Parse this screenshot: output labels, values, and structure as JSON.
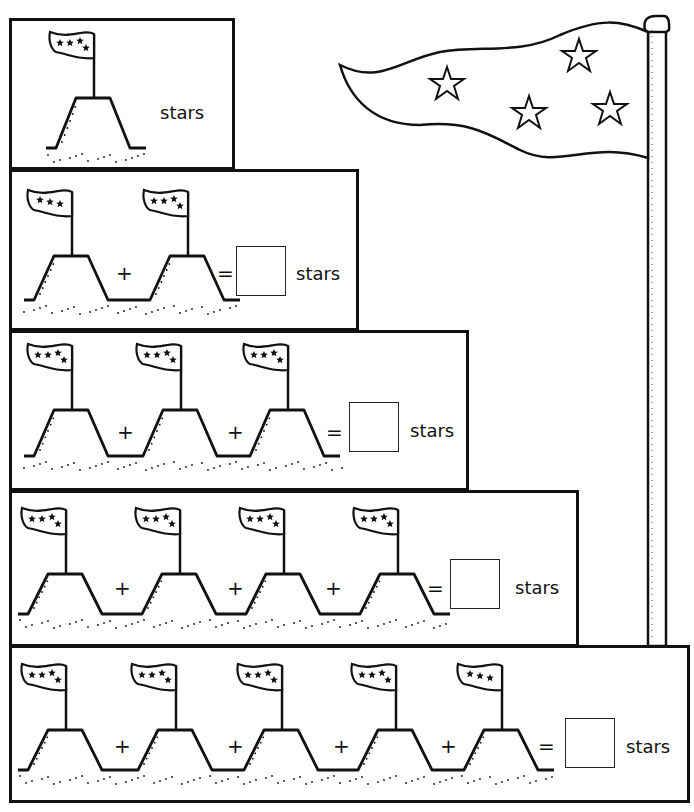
{
  "worksheet": {
    "unit_label": "stars",
    "plus_sign": "+",
    "equals_sign": "=",
    "rows": [
      {
        "id": 1,
        "flags": [
          4
        ],
        "has_answer_box": false,
        "answer": ""
      },
      {
        "id": 2,
        "flags": [
          3,
          4
        ],
        "has_answer_box": true,
        "answer": ""
      },
      {
        "id": 3,
        "flags": [
          4,
          4,
          4
        ],
        "has_answer_box": true,
        "answer": ""
      },
      {
        "id": 4,
        "flags": [
          4,
          4,
          4,
          4
        ],
        "has_answer_box": true,
        "answer": ""
      },
      {
        "id": 5,
        "flags": [
          4,
          4,
          4,
          4,
          3
        ],
        "has_answer_box": true,
        "answer": ""
      }
    ],
    "big_flag_stars": 4
  },
  "colors": {
    "ink": "#111111",
    "paper": "#ffffff"
  }
}
